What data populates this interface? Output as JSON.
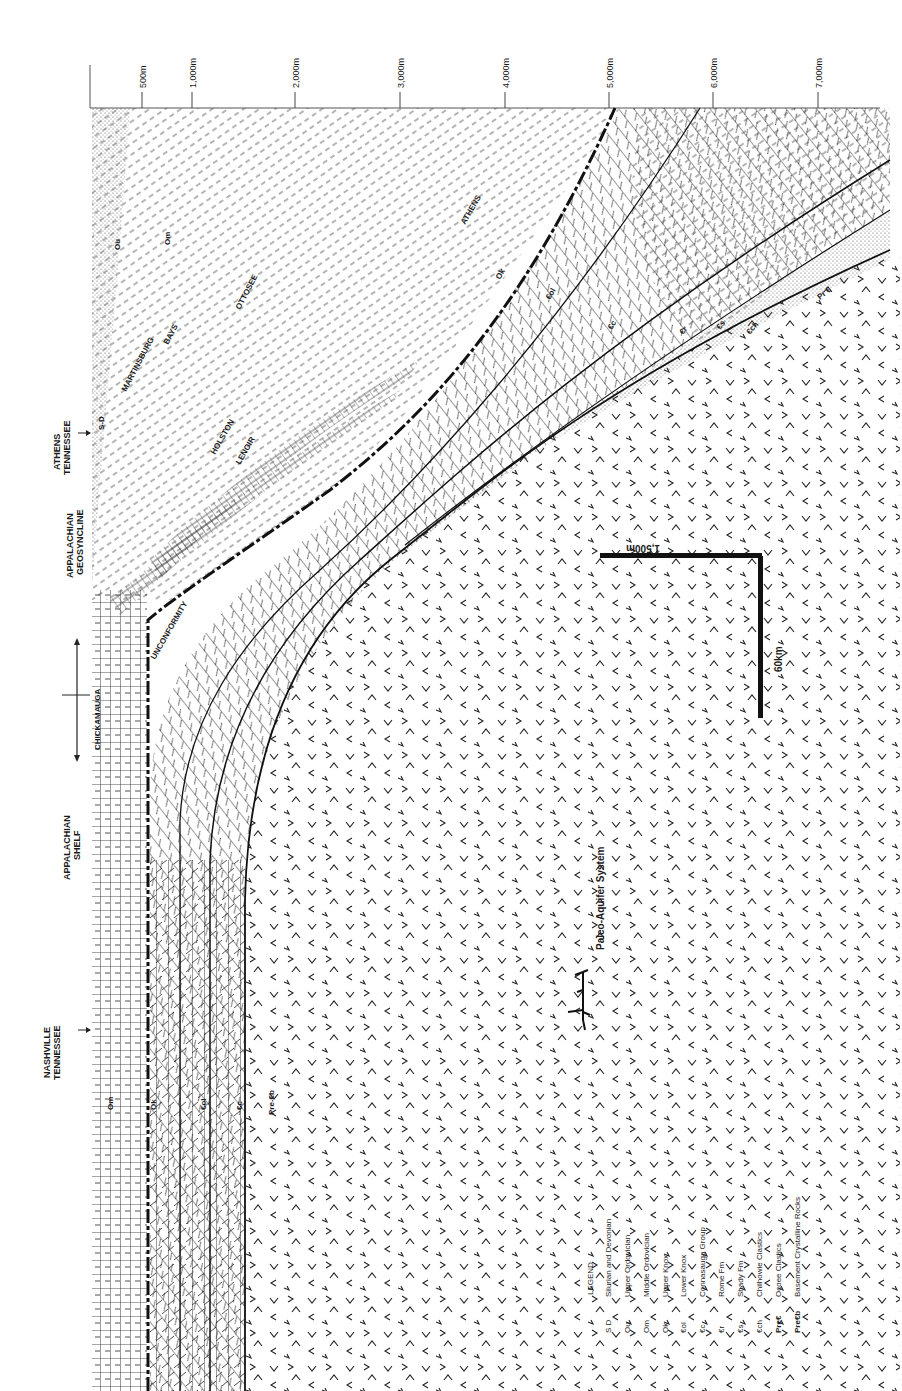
{
  "figure": {
    "orientation": "rotated 90° clockwise; depth increases to the right, distance runs top-to-bottom"
  },
  "depth_axis": {
    "ticks": [
      {
        "label": "500m",
        "x": 142
      },
      {
        "label": "1,000m",
        "x": 192
      },
      {
        "label": "2,000m",
        "x": 295
      },
      {
        "label": "3,000m",
        "x": 400
      },
      {
        "label": "4,000m",
        "x": 505
      },
      {
        "label": "5,000m",
        "x": 609
      },
      {
        "label": "6,000m",
        "x": 713
      },
      {
        "label": "7,000m",
        "x": 818
      }
    ]
  },
  "locations": [
    {
      "id": "athens",
      "label_line1": "ATHENS",
      "label_line2": "TENNESSEE",
      "marker": "arrow"
    },
    {
      "id": "geosyncline",
      "label_line1": "APPALACHIAN",
      "label_line2": "GEOSYNCLINE"
    },
    {
      "id": "chickamauga-range",
      "marker": "double-arrow"
    },
    {
      "id": "shelf",
      "label_line1": "APPALACHIAN",
      "label_line2": "SHELF"
    },
    {
      "id": "nashville",
      "label_line1": "NASHVILLE",
      "label_line2": "TENNESSEE",
      "marker": "arrow"
    }
  ],
  "section_labels": {
    "sd": "S-D",
    "ou": "Ou",
    "om_top": "Om",
    "martinsburg": "MARTINSBURG",
    "bays": "BAYS",
    "ottosee": "OTTOSEE",
    "holston": "HOLSTON",
    "lenoir": "LENOIR",
    "athens": "ATHENS",
    "unconformity": "UNCONFORMITY",
    "chickamauga": "CHICKAMAUGA",
    "ok_top": "Ok",
    "col_top": "€ol",
    "cc_top": "€c",
    "cr": "€r",
    "cs": "€s",
    "cch": "€ch",
    "prec": "Pr €",
    "om_bottom": "Om",
    "ok_bottom": "Ok",
    "col_bottom": "€ol",
    "cc_bottom": "€c",
    "precb": "Pre-€b"
  },
  "scale_bar": {
    "vertical_label": "1,500m",
    "horizontal_label": "60km"
  },
  "paleo_aquifer": {
    "label": "Paleo-Aquifer System",
    "icon": "paleo-aquifer-symbol"
  },
  "legend": {
    "title": "LEGEND",
    "items": [
      {
        "code": "S D",
        "name": "Silurian and Devonian"
      },
      {
        "code": "Ou",
        "name": "Upper Ordovician"
      },
      {
        "code": "Om",
        "name": "Middle Ordovician"
      },
      {
        "code": "Ok",
        "name": "Upper Knox"
      },
      {
        "code": "€ol",
        "name": "Lower Knox"
      },
      {
        "code": "€c",
        "name": "Connasauga Group"
      },
      {
        "code": "€r",
        "name": "Rome Fm"
      },
      {
        "code": "€s",
        "name": "Shady Fm"
      },
      {
        "code": "€ch",
        "name": "Chilhowie Clastics"
      },
      {
        "code": "Pre€",
        "name": "Ocoee Clastics"
      },
      {
        "code": "Pre€b",
        "name": "Basement Crystalline Rocks"
      }
    ]
  }
}
